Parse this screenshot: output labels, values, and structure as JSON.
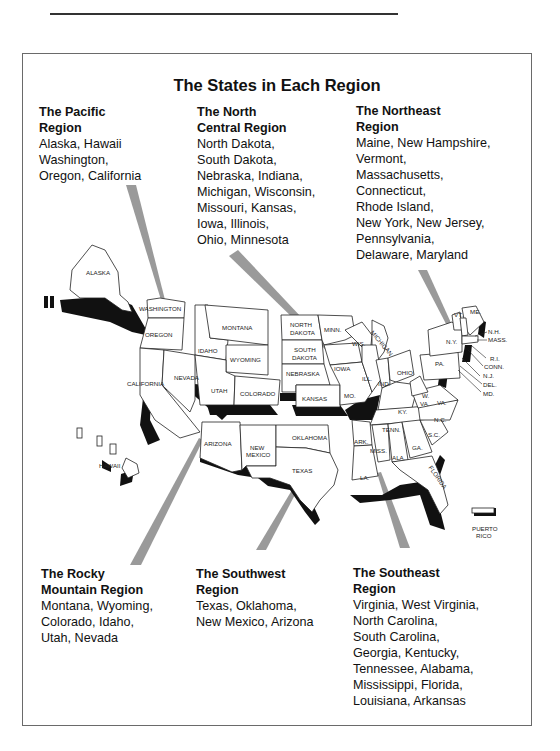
{
  "title": "The States in Each Region",
  "regions": {
    "pacific": {
      "heading": [
        "The Pacific",
        "Region"
      ],
      "lines": [
        "Alaska, Hawaii",
        "Washington,",
        "Oregon, California"
      ]
    },
    "north_central": {
      "heading": [
        "The North",
        "Central Region"
      ],
      "lines": [
        "North Dakota,",
        "South Dakota,",
        "Nebraska, Indiana,",
        "Michigan, Wisconsin,",
        "Missouri, Kansas,",
        "Iowa, Illinois,",
        "Ohio, Minnesota"
      ]
    },
    "northeast": {
      "heading": [
        "The Northeast",
        "Region"
      ],
      "lines": [
        "Maine, New Hampshire,",
        "Vermont,",
        "Massachusetts,",
        "Connecticut,",
        "Rhode Island,",
        "New York, New Jersey,",
        "Pennsylvania,",
        "Delaware, Maryland"
      ]
    },
    "rocky_mountain": {
      "heading": [
        "The Rocky",
        "Mountain Region"
      ],
      "lines": [
        "Montana, Wyoming,",
        "Colorado, Idaho,",
        "Utah, Nevada"
      ]
    },
    "southwest": {
      "heading": [
        "The Southwest",
        "Region"
      ],
      "lines": [
        "Texas, Oklahoma,",
        "New Mexico, Arizona"
      ]
    },
    "southeast": {
      "heading": [
        "The Southeast",
        "Region"
      ],
      "lines": [
        "Virginia, West Virginia,",
        "North Carolina,",
        "South Carolina,",
        "Georgia, Kentucky,",
        "Tennessee, Alabama,",
        "Mississippi, Florida,",
        "Louisiana, Arkansas"
      ]
    }
  },
  "map_labels": {
    "alaska": "ALASKA",
    "hawaii": "HAWAII",
    "washington": "WASHINGTON",
    "oregon": "OREGON",
    "california": "CALIFORNIA",
    "nevada": "NEVADA",
    "idaho": "IDAHO",
    "montana": "MONTANA",
    "wyoming": "WYOMING",
    "utah": "UTAH",
    "colorado": "COLORADO",
    "arizona": "ARIZONA",
    "new_mexico_1": "NEW",
    "new_mexico_2": "MEXICO",
    "north_dakota_1": "NORTH",
    "north_dakota_2": "DAKOTA",
    "south_dakota_1": "SOUTH",
    "south_dakota_2": "DAKOTA",
    "nebraska": "NEBRASKA",
    "kansas": "KANSAS",
    "oklahoma": "OKLAHOMA",
    "texas": "TEXAS",
    "minnesota": "MINN.",
    "iowa": "IOWA",
    "missouri": "MO.",
    "wisconsin": "WIS.",
    "michigan": "MICHIGAN",
    "illinois": "ILL.",
    "indiana": "IND.",
    "ohio": "OHIO",
    "kentucky": "KY.",
    "tennessee": "TENN.",
    "arkansas": "ARK.",
    "louisiana": "LA.",
    "mississippi": "MISS.",
    "alabama": "ALA.",
    "georgia": "GA.",
    "florida": "FLORIDA",
    "south_carolina": "S.C.",
    "north_carolina": "N.C.",
    "virginia": "VA.",
    "west_virginia_1": "W.",
    "west_virginia_2": "VA.",
    "pennsylvania": "PA.",
    "new_york": "N.Y.",
    "vermont": "VT.",
    "maine": "ME.",
    "new_hampshire": "N.H.",
    "massachusetts": "MASS.",
    "rhode_island": "R.I.",
    "connecticut": "CONN.",
    "new_jersey": "N.J.",
    "delaware": "DEL.",
    "maryland": "MD.",
    "puerto_rico_1": "PUERTO",
    "puerto_rico_2": "RICO"
  },
  "colors": {
    "beam": "#9a9a9a",
    "shadow": "#111111",
    "frame": "#6a6a6a"
  }
}
